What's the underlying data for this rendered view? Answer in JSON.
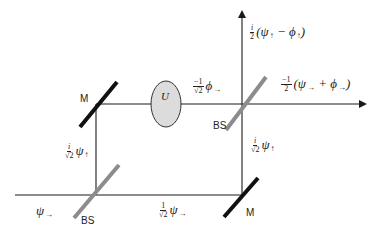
{
  "diagram": {
    "type": "Mach-Zehnder interferometer",
    "components": {
      "mirror_top_left": {
        "label": "M"
      },
      "mirror_bottom_right": {
        "label": "M"
      },
      "beam_splitter_bottom_left": {
        "label": "BS"
      },
      "beam_splitter_top_right": {
        "label": "BS"
      },
      "unitary": {
        "label": "U"
      }
    },
    "labels": {
      "input": {
        "symbol": "ψ",
        "arrow": "→"
      },
      "left_vertical": {
        "num": "i",
        "den": "√2",
        "symbol": "ψ",
        "arrow": "↑"
      },
      "bottom_horizontal": {
        "num": "1",
        "den": "√2",
        "symbol": "ψ",
        "arrow": "→"
      },
      "right_vertical": {
        "num": "i",
        "den": "√2",
        "symbol": "ψ",
        "arrow": "↑"
      },
      "top_horizontal": {
        "num": "−1",
        "den": "√2",
        "symbol": "ϕ",
        "arrow": "→"
      },
      "output_up": {
        "num": "i",
        "den": "2",
        "expr_open": "(ψ",
        "arrow1": "↑",
        "op": " − ϕ",
        "arrow2": "↑",
        "expr_close": ")"
      },
      "output_right": {
        "num": "−1",
        "den": "2",
        "expr_open": "(ψ",
        "arrow1": "→",
        "op": " + ϕ",
        "arrow2": "→",
        "expr_close": ")"
      }
    },
    "colors": {
      "beam": "#1a1a1a",
      "mirror": "#111111",
      "beam_splitter": "#8c8c8c",
      "unitary_fill": "#dcdcdc",
      "unitary_stroke": "#333333"
    }
  }
}
